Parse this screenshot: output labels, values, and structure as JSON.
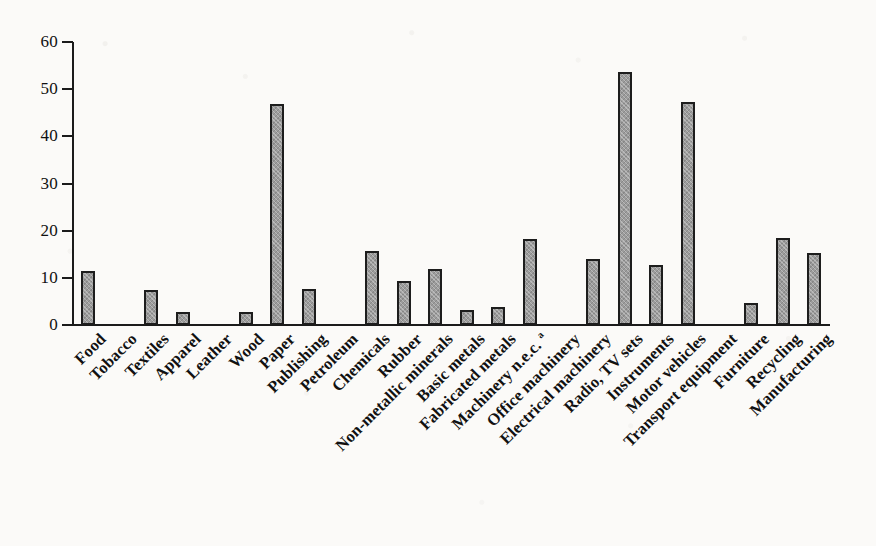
{
  "chart_data": {
    "type": "bar",
    "title": "",
    "subtitle": "",
    "xlabel": "",
    "ylabel": "",
    "ylim": [
      0,
      60
    ],
    "yticks": [
      0,
      10,
      20,
      30,
      40,
      50,
      60
    ],
    "ytick_labels": [
      "0",
      "10",
      "20",
      "30",
      "40",
      "50",
      "60"
    ],
    "grid": false,
    "legend": null,
    "orientation": "vertical",
    "label_rotation_deg": 45,
    "categories": [
      "Food",
      "Tobacco",
      "Textiles",
      "Apparel",
      "Leather",
      "Wood",
      "Paper",
      "Publishing",
      "Petroleum",
      "Chemicals",
      "Rubber",
      "Non-metallic minerals",
      "Basic metals",
      "Fabricated metals",
      "Machinery n.e.c. a",
      "Office machinery",
      "Electrical machinery",
      "Radio, TV sets",
      "Instruments",
      "Motor vehicles",
      "Transport equipment",
      "Furniture",
      "Recycling",
      "Manufacturing"
    ],
    "category_labels_html": [
      "Food",
      "Tobacco",
      "Textiles",
      "Apparel",
      "Leather",
      "Wood",
      "Paper",
      "Publishing",
      "Petroleum",
      "Chemicals",
      "Rubber",
      "Non-metallic minerals",
      "Basic metals",
      "Fabricated metals",
      "Machinery n.e.c. <sup>a</sup>",
      "Office machinery",
      "Electrical machinery",
      "Radio, TV sets",
      "Instruments",
      "Motor vehicles",
      "Transport equipment",
      "Furniture",
      "Recycling",
      "Manufacturing"
    ],
    "values": [
      11.4,
      0,
      7.5,
      2.8,
      0,
      2.8,
      46.9,
      7.6,
      0,
      15.7,
      9.3,
      11.8,
      3.2,
      3.9,
      18.2,
      0,
      14.1,
      53.7,
      12.7,
      47.2,
      0,
      4.7,
      18.4,
      15.2
    ],
    "footnote_marker": "a",
    "colors": {
      "bar_fill": "#9c9c9c",
      "bar_border": "#1d1d1d",
      "axis": "#1b1b1b",
      "text": "#111111",
      "background": "#fbfaf8"
    }
  }
}
